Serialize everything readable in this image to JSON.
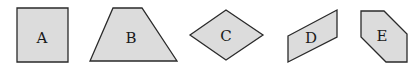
{
  "colors": {
    "fill": "#dcdcdc",
    "stroke": "#2a2a2a",
    "text": "#1a1a1a"
  },
  "shapes": [
    {
      "label": "A",
      "type": "square",
      "points": "17,8 68,8 68,62 17,62",
      "label_pos": [
        42,
        38
      ]
    },
    {
      "label": "B",
      "type": "trapezoid",
      "points": "113,8 142,8 177,61 90,61",
      "label_pos": [
        127,
        38
      ]
    },
    {
      "label": "C",
      "type": "rhombus",
      "points": "190,35 226,10 263,35 226,60",
      "label_pos": [
        226,
        36
      ]
    },
    {
      "label": "D",
      "type": "parallelogram",
      "points": "288,36 337,10 337,37 288,62",
      "label_pos": [
        311,
        38
      ]
    },
    {
      "label": "E",
      "type": "hexagon",
      "points": "361,11 384,11 407,34 407,62 386,62 361,37",
      "label_pos": [
        382,
        36
      ]
    }
  ]
}
